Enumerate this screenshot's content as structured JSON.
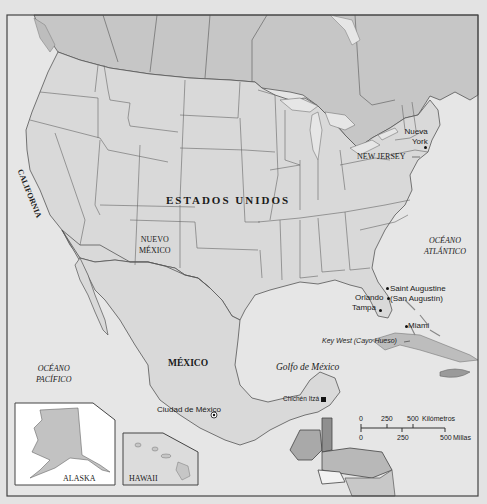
{
  "map": {
    "colors": {
      "page_background": "#e3e3e3",
      "water": "#e6e6e6",
      "usa_land": "#d9d9d9",
      "canada_land": "#c6c6c6",
      "central_america_highlight": "#a9a9a9",
      "belize_highlight": "#8f8f8f",
      "inset_background": "#ffffff",
      "border_lines": "#555555"
    },
    "labels": {
      "country_usa": "ESTADOS UNIDOS",
      "country_mexico": "MÉXICO",
      "state_california": "CALIFORNIA",
      "state_new_mexico_line1": "NUEVO",
      "state_new_mexico_line2": "MÉXICO",
      "state_new_jersey": "NEW JERSEY",
      "ocean_atlantic_line1": "OCÉANO",
      "ocean_atlantic_line2": "ATLÁNTICO",
      "ocean_pacific_line1": "OCÉANO",
      "ocean_pacific_line2": "PACÍFICO",
      "gulf": "Golfo de México"
    },
    "cities": [
      {
        "name_line1": "Nueva",
        "name_line2": "York",
        "marker": "dot"
      },
      {
        "name_line1": "Saint Augustine",
        "name_line2": "(San Augustín)",
        "marker": "dot"
      },
      {
        "name": "Orlando",
        "marker": "dot"
      },
      {
        "name": "Tampa",
        "marker": "dot"
      },
      {
        "name": "Miami",
        "marker": "dot"
      },
      {
        "name": "Key West (Cayo Hueso)",
        "marker": "leader-line"
      },
      {
        "name": "Ciudad de México",
        "marker": "star-circle"
      },
      {
        "name": "Chichén Itzá",
        "marker": "square"
      }
    ],
    "insets": [
      {
        "name": "ALASKA"
      },
      {
        "name": "HAWAII"
      }
    ],
    "scale": {
      "km_ticks": [
        "0",
        "250",
        "500"
      ],
      "km_unit": "Kilómetros",
      "mi_ticks": [
        "0",
        "250",
        "500"
      ],
      "mi_unit": "Millas"
    }
  }
}
